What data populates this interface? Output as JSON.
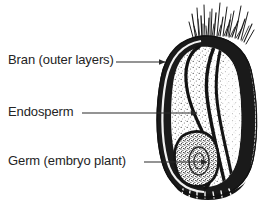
{
  "figure": {
    "background_color": "#ffffff",
    "ink_color": "#1a1a1a",
    "text_color": "#242424"
  },
  "labels": [
    {
      "id": "bran",
      "text": "Bran (outer layers)",
      "x": 8,
      "y": 52,
      "leader": {
        "x1": 116,
        "y1": 62,
        "x2": 165,
        "y2": 62,
        "arrow": true
      }
    },
    {
      "id": "endosperm",
      "text": "Endosperm",
      "x": 8,
      "y": 104,
      "leader": {
        "x1": 82,
        "y1": 113,
        "x2": 197,
        "y2": 113,
        "arrow": true
      }
    },
    {
      "id": "germ",
      "text": "Germ (embryo plant)",
      "x": 8,
      "y": 153,
      "leader": {
        "x1": 144,
        "y1": 162,
        "x2": 207,
        "y2": 162,
        "arrow": true
      }
    }
  ],
  "diagram": {
    "parts": [
      {
        "name": "brush-hairs",
        "description": "tuft of fine hairs at top of kernel"
      },
      {
        "name": "bran",
        "description": "thick dark outer layers band"
      },
      {
        "name": "endosperm",
        "description": "large stippled interior region"
      },
      {
        "name": "germ",
        "description": "embryo plant at lower left, dense stipple"
      },
      {
        "name": "crease",
        "description": "ventral groove along right side"
      },
      {
        "name": "base",
        "description": "dark rounded kernel base"
      }
    ]
  }
}
